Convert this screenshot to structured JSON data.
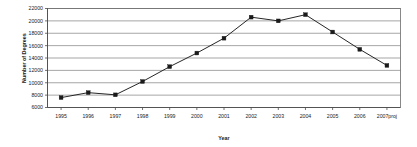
{
  "chart_data": {
    "type": "line",
    "title": "",
    "subtitle": "",
    "xlabel": "Year",
    "ylabel": "Number of Degrees",
    "categories": [
      "1995",
      "1996",
      "1997",
      "1998",
      "1999",
      "2000",
      "2001",
      "2002",
      "2003",
      "2004",
      "2005",
      "2006",
      "2007proj"
    ],
    "values": [
      7600,
      8400,
      8050,
      10200,
      12600,
      14800,
      17200,
      20600,
      20000,
      21000,
      18200,
      15400,
      12800
    ],
    "series": [
      {
        "name": "Number of Degrees",
        "values": [
          7600,
          8400,
          8050,
          10200,
          12600,
          14800,
          17200,
          20600,
          20000,
          21000,
          18200,
          15400,
          12800
        ]
      }
    ],
    "ylim": [
      6000,
      22000
    ],
    "ytick_labels": [
      "6000",
      "8000",
      "10000",
      "12000",
      "14000",
      "16000",
      "18000",
      "20000",
      "22000"
    ],
    "ytick_values": [
      6000,
      8000,
      10000,
      12000,
      14000,
      16000,
      18000,
      20000,
      22000
    ],
    "ytick_step": 2000,
    "xtick_labels": [
      "1995",
      "1996",
      "1997",
      "1998",
      "1999",
      "2000",
      "2001",
      "2002",
      "2003",
      "2004",
      "2005",
      "2006",
      "2007proj"
    ],
    "grid": "horizontal",
    "legend": "none",
    "marker": "square",
    "colors": {
      "line": "#262626",
      "marker": "#1a1a1a",
      "gridline": "#808080",
      "frame": "#6b6b6b",
      "text": "#1a1a1a",
      "background": "#ffffff"
    }
  }
}
